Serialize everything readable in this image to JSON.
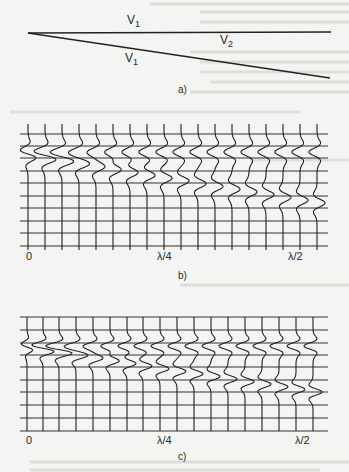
{
  "figure": {
    "panel_a": {
      "caption": "a)",
      "labels": {
        "upper_velocity": {
          "base": "V",
          "sub": "1"
        },
        "wedge_velocity": {
          "base": "V",
          "sub": "2"
        },
        "lower_velocity": {
          "base": "V",
          "sub": "1"
        }
      },
      "geometry": {
        "apex": [
          28,
          33
        ],
        "top_line_end": [
          331,
          32
        ],
        "bottom_line_end": [
          330,
          78
        ]
      }
    },
    "panel_b": {
      "caption": "b)",
      "axis_labels": {
        "start": "0",
        "quarter": "λ/4",
        "half": "λ/2"
      },
      "grid": {
        "x0": 20,
        "x1": 328,
        "rows_y": [
          134,
          146,
          158,
          171,
          183,
          196,
          208,
          221,
          233,
          246
        ]
      },
      "traces_x": [
        28,
        45,
        62,
        79,
        96,
        113,
        130,
        147,
        164,
        181,
        198,
        215,
        232,
        249,
        266,
        283,
        300,
        317
      ],
      "trace_top": 124,
      "trace_bottom": 250,
      "top_arrival_y": 152,
      "base_arrival_start_y": 156,
      "base_arrival_end_y": 203,
      "amplitude": 9
    },
    "panel_c": {
      "caption": "c)",
      "axis_labels": {
        "start": "0",
        "quarter": "λ/4",
        "half": "λ/2"
      },
      "grid": {
        "x0": 20,
        "x1": 328,
        "rows_y": [
          317,
          330,
          343,
          355,
          367,
          380,
          392,
          405,
          418,
          431
        ]
      },
      "traces_x": [
        27,
        43,
        59,
        76,
        93,
        110,
        127,
        143,
        160,
        177,
        194,
        211,
        228,
        245,
        262,
        279,
        296,
        313
      ],
      "trace_top": 317,
      "trace_bottom": 431,
      "top_arrival_y": 346,
      "base_arrival_start_y": 348,
      "base_arrival_end_y": 392,
      "amplitude": 9
    }
  }
}
